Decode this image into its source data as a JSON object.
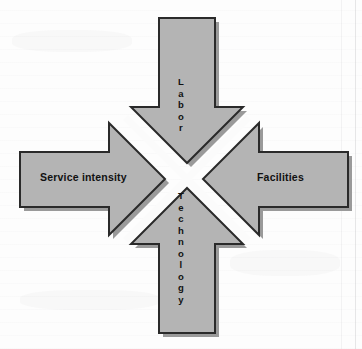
{
  "document": {
    "type": "scanned-page-figure",
    "background_color": "#fdfdfd"
  },
  "figure": {
    "name": "converging-four-headed-arrow-cross",
    "fill_color": "#b4b4b4",
    "stroke_color": "#2a2a2a",
    "shadow_color": "#9a9a9a",
    "gap_color": "#fbfbfb",
    "arrows": [
      {
        "id": "left",
        "direction": "points-right-toward-center",
        "label": "Service intensity",
        "orientation": "horizontal"
      },
      {
        "id": "right",
        "direction": "points-left-toward-center",
        "label": "Facilities",
        "orientation": "horizontal"
      },
      {
        "id": "top",
        "direction": "points-down-toward-center",
        "label": "Labor",
        "orientation": "vertical-stacked",
        "letters": [
          "L",
          "a",
          "b",
          "o",
          "r"
        ]
      },
      {
        "id": "bottom",
        "direction": "points-up-toward-center",
        "label": "Technology",
        "orientation": "vertical-stacked",
        "letters": [
          "T",
          "e",
          "c",
          "h",
          "n",
          "o",
          "l",
          "o",
          "g",
          "y"
        ]
      }
    ]
  }
}
